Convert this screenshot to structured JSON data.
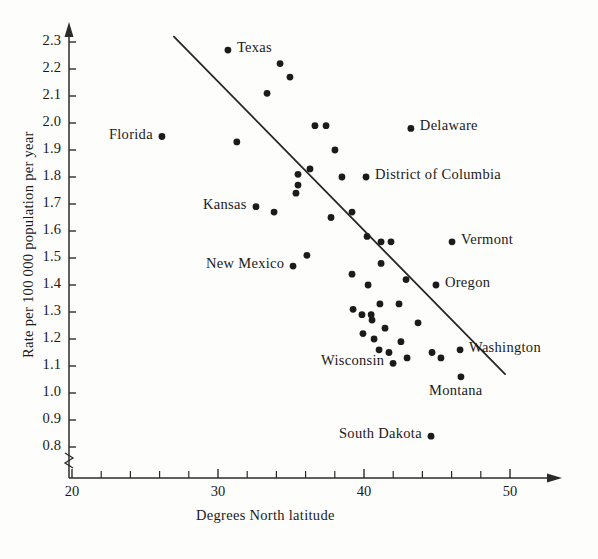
{
  "chart_data": {
    "type": "scatter",
    "title": "",
    "xlabel": "Degrees North latitude",
    "ylabel": "Rate per 100 000 population per year",
    "xlim": [
      20,
      51.7
    ],
    "ylim": [
      0.76,
      2.36
    ],
    "x_ticks_major": [
      20,
      30,
      40,
      50
    ],
    "x_ticks_minor": [
      22,
      24,
      26,
      28,
      32,
      34,
      36,
      38,
      42,
      44,
      46,
      48
    ],
    "y_ticks": [
      0.8,
      0.9,
      1.0,
      1.1,
      1.2,
      1.3,
      1.4,
      1.5,
      1.6,
      1.7,
      1.8,
      1.9,
      2.0,
      2.1,
      2.2,
      2.3
    ],
    "y_tick_labels": [
      "0.8",
      "0.9",
      "1.0",
      "1.1",
      "1.2",
      "1.3",
      "1.4",
      "1.5",
      "1.6",
      "1.7",
      "1.8",
      "1.9",
      "2.0",
      "2.1",
      "2.2",
      "2.3"
    ],
    "x_tick_labels": [
      "20",
      "30",
      "40",
      "50"
    ],
    "grid": false,
    "legend": null,
    "y_axis_break": true,
    "fit_line": {
      "label": "regression line",
      "x_start": 26.98,
      "y_start": 2.32,
      "x_end": 49.66,
      "y_end": 1.07
    },
    "labeled_points": [
      {
        "label": "Texas",
        "x": 30.68,
        "y": 2.27
      },
      {
        "label": "Florida",
        "x": 26.16,
        "y": 1.95
      },
      {
        "label": "Delaware",
        "x": 43.21,
        "y": 1.98
      },
      {
        "label": "District of Columbia",
        "x": 40.14,
        "y": 1.8
      },
      {
        "label": "Kansas",
        "x": 32.6,
        "y": 1.69
      },
      {
        "label": "Vermont",
        "x": 46.03,
        "y": 1.56
      },
      {
        "label": "New Mexico",
        "x": 35.14,
        "y": 1.47
      },
      {
        "label": "Oregon",
        "x": 44.93,
        "y": 1.4
      },
      {
        "label": "Washington",
        "x": 46.58,
        "y": 1.16
      },
      {
        "label": "Montana",
        "x": 46.64,
        "y": 1.06
      },
      {
        "label": "Wisconsin",
        "x": 41.99,
        "y": 1.11
      },
      {
        "label": "South Dakota",
        "x": 44.59,
        "y": 0.84
      }
    ],
    "unlabeled_points": [
      {
        "x": 34.25,
        "y": 2.22
      },
      {
        "x": 34.93,
        "y": 2.17
      },
      {
        "x": 33.36,
        "y": 2.11
      },
      {
        "x": 36.64,
        "y": 1.99
      },
      {
        "x": 37.4,
        "y": 1.99
      },
      {
        "x": 31.29,
        "y": 1.93
      },
      {
        "x": 38.01,
        "y": 1.9
      },
      {
        "x": 36.3,
        "y": 1.83
      },
      {
        "x": 35.48,
        "y": 1.81
      },
      {
        "x": 38.49,
        "y": 1.8
      },
      {
        "x": 35.48,
        "y": 1.77
      },
      {
        "x": 35.34,
        "y": 1.74
      },
      {
        "x": 33.84,
        "y": 1.67
      },
      {
        "x": 39.18,
        "y": 1.67
      },
      {
        "x": 37.74,
        "y": 1.65
      },
      {
        "x": 40.21,
        "y": 1.58
      },
      {
        "x": 41.17,
        "y": 1.56
      },
      {
        "x": 41.85,
        "y": 1.56
      },
      {
        "x": 36.09,
        "y": 1.51
      },
      {
        "x": 41.17,
        "y": 1.48
      },
      {
        "x": 39.18,
        "y": 1.44
      },
      {
        "x": 42.88,
        "y": 1.42
      },
      {
        "x": 40.28,
        "y": 1.4
      },
      {
        "x": 41.09,
        "y": 1.33
      },
      {
        "x": 42.4,
        "y": 1.33
      },
      {
        "x": 39.25,
        "y": 1.31
      },
      {
        "x": 39.86,
        "y": 1.29
      },
      {
        "x": 40.49,
        "y": 1.29
      },
      {
        "x": 40.55,
        "y": 1.27
      },
      {
        "x": 43.7,
        "y": 1.26
      },
      {
        "x": 41.44,
        "y": 1.24
      },
      {
        "x": 39.93,
        "y": 1.22
      },
      {
        "x": 40.69,
        "y": 1.2
      },
      {
        "x": 42.53,
        "y": 1.19
      },
      {
        "x": 41.03,
        "y": 1.16
      },
      {
        "x": 41.71,
        "y": 1.15
      },
      {
        "x": 44.66,
        "y": 1.15
      },
      {
        "x": 42.95,
        "y": 1.13
      },
      {
        "x": 45.27,
        "y": 1.13
      }
    ]
  },
  "axis": {
    "x_title": "Degrees North latitude",
    "y_title": "Rate per 100 000 population per year"
  }
}
